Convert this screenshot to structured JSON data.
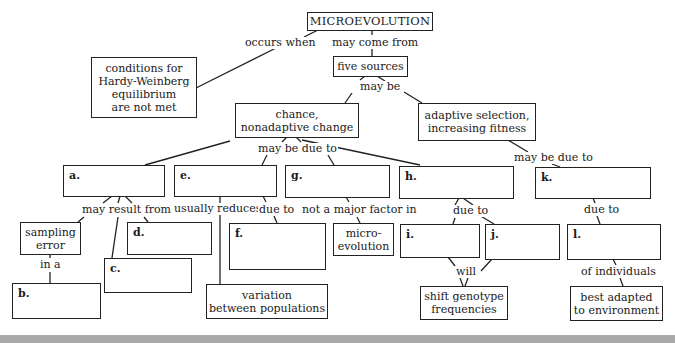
{
  "diagram": {
    "title": "MICROEVOLUTION",
    "nodes": {
      "microevolution": "MICROEVOLUTION",
      "conditions": "conditions for Hardy-Weinberg equilibrium are not met",
      "conditions_lines": [
        "conditions for",
        "Hardy-Weinberg",
        "equilibrium",
        "are not met"
      ],
      "five_sources": "five sources",
      "chance_lines": [
        "chance,",
        "nonadaptive change"
      ],
      "adaptive_lines": [
        "adaptive selection,",
        "increasing fitness"
      ],
      "sampling_lines": [
        "sampling",
        "error"
      ],
      "microevolution2_lines": [
        "micro-",
        "evolution"
      ],
      "variation_lines": [
        "variation",
        "between populations"
      ],
      "shift_lines": [
        "shift genotype",
        "frequencies"
      ],
      "best_lines": [
        "best adapted",
        "to environment"
      ]
    },
    "blanks": {
      "a": "a.",
      "b": "b.",
      "c": "c.",
      "d": "d.",
      "e": "e.",
      "f": "f.",
      "g": "g.",
      "h": "h.",
      "i": "i.",
      "j": "j.",
      "k": "k.",
      "l": "l."
    },
    "links": {
      "occurs_when": "occurs when",
      "may_come_from": "may come from",
      "may_be": "may be",
      "may_be_due_to_1": "may be due to",
      "may_be_due_to_2": "may be due to",
      "may_result_from": "may result from",
      "usually_reduces": "usually reduces",
      "due_to_f": "due to",
      "not_major": "not a major factor in",
      "due_to_h": "due to",
      "due_to_k": "due to",
      "in_a": "in a",
      "will": "will",
      "of_individuals": "of individuals"
    }
  }
}
